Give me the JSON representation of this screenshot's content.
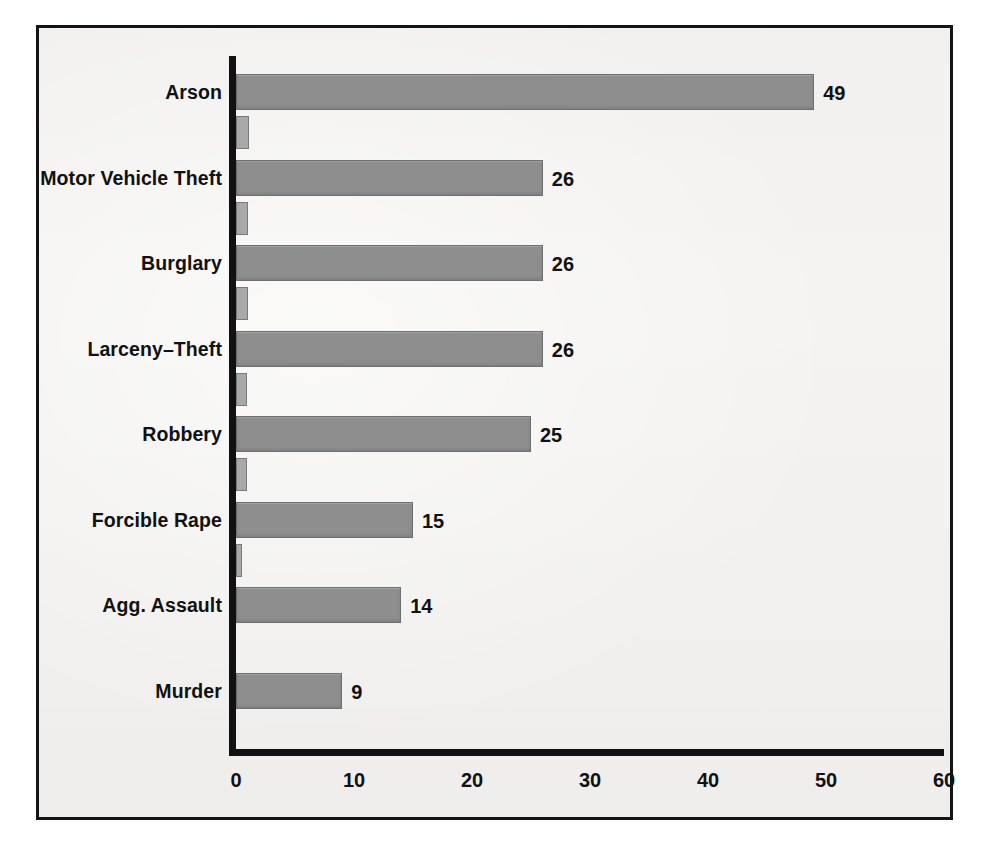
{
  "chart_data": {
    "type": "bar",
    "orientation": "horizontal",
    "title": "",
    "subtitle": "",
    "xlabel": "",
    "ylabel": "",
    "xlim": [
      0,
      60
    ],
    "xticks": [
      "0",
      "10",
      "20",
      "30",
      "40",
      "50",
      "60"
    ],
    "xtick_values": [
      0,
      10,
      20,
      30,
      40,
      50,
      60
    ],
    "grid": false,
    "legend": "none",
    "categories": [
      "Arson",
      "Motor Vehicle Theft",
      "Burglary",
      "Larceny–Theft",
      "Robbery",
      "Forcible Rape",
      "Agg. Assault",
      "Murder"
    ],
    "series": [
      {
        "name": "primary",
        "values": [
          49,
          26,
          26,
          26,
          25,
          15,
          14,
          9
        ],
        "labels": [
          "49",
          "26",
          "26",
          "26",
          "25",
          "15",
          "14",
          "9"
        ],
        "color": "#8e8e8e"
      },
      {
        "name": "secondary",
        "values": [
          1.1,
          1.0,
          1.0,
          0.9,
          0.9,
          0.5,
          0,
          0
        ],
        "labels": [
          "",
          "",
          "",
          "",
          "",
          "",
          "",
          ""
        ],
        "color": "#a9a9a9"
      }
    ]
  },
  "figure": {
    "background_color": "#f4f3f1",
    "frame_color": "#141414",
    "axis_color": "#111111",
    "text_color": "#111111"
  }
}
